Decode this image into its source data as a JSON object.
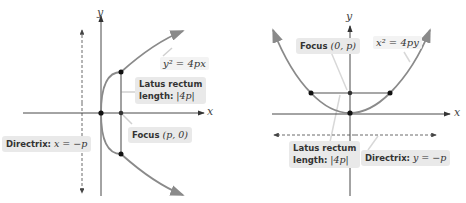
{
  "left_diagram": {
    "equation": "y² = 4px",
    "x_axis_label": "x",
    "y_axis_label": "y",
    "latus_rectum": {
      "line1": "Latus rectum",
      "line2_prefix": "length: ",
      "line2_math": "|4p|"
    },
    "focus": {
      "prefix": "Focus ",
      "math": "(p, 0)"
    },
    "directrix": {
      "prefix": "Directrix: ",
      "math": "x = −p"
    }
  },
  "right_diagram": {
    "equation": "x² = 4py",
    "x_axis_label": "x",
    "y_axis_label": "y",
    "latus_rectum": {
      "line1": "Latus rectum",
      "line2_prefix": "length: ",
      "line2_math": "|4p|"
    },
    "focus": {
      "prefix": "Focus ",
      "math": "(0, p)"
    },
    "directrix": {
      "prefix": "Directrix: ",
      "math": "y = −p"
    }
  },
  "colors": {
    "curve": "#8a8a8a",
    "axis": "#333333",
    "label_box": "#e9e9e9",
    "point": "#111111"
  }
}
